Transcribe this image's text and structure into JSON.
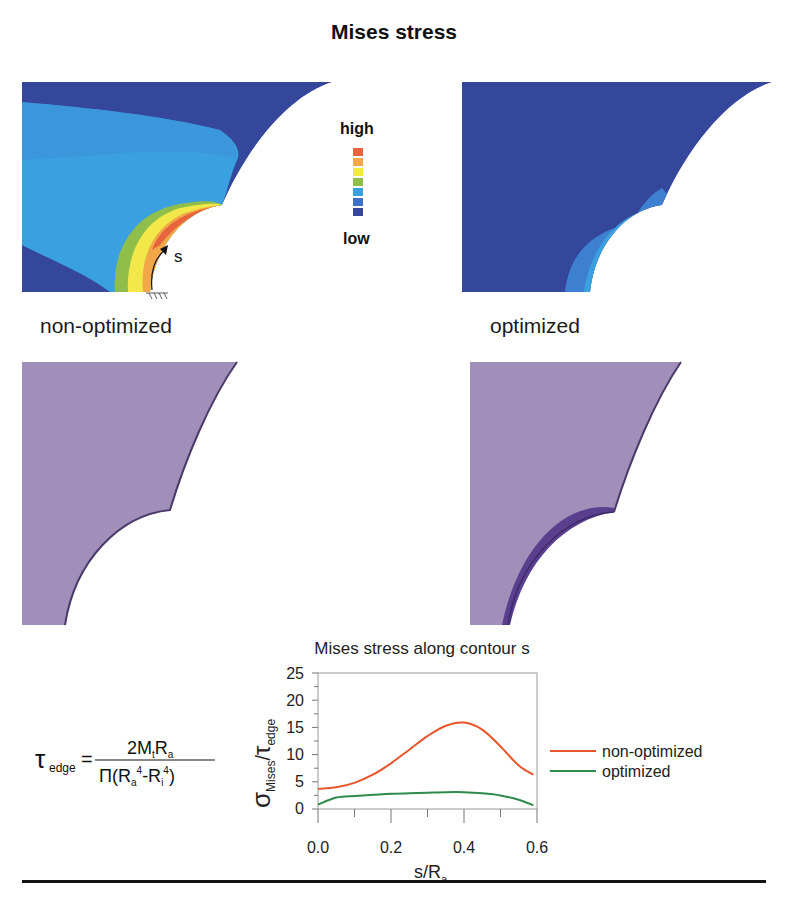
{
  "title": "Mises stress",
  "panels": {
    "stress_left_caption": "non-optimized",
    "stress_right_caption": "optimized",
    "contour_arrow_label": "s"
  },
  "color_legend": {
    "high_label": "high",
    "low_label": "low",
    "colors": [
      "#e8643c",
      "#f2a748",
      "#f2e84a",
      "#8fbf4a",
      "#3aa0e0",
      "#3e70c8",
      "#34479a"
    ]
  },
  "colors": {
    "stress_low": "#34479a",
    "stress_midlow": "#3e70c8",
    "stress_mid": "#3aa0e0",
    "stress_green": "#8fbf4a",
    "stress_yellow": "#f2e84a",
    "stress_orange": "#f2a748",
    "stress_high": "#e8643c",
    "geometry_fill": "#a08fb8",
    "geometry_edge": "#4a3a6a",
    "optimized_band": "#5a3f8f"
  },
  "formula": {
    "lhs_symbol": "τ",
    "lhs_sub": "edge",
    "equals": "=",
    "numerator": "2M",
    "num_sub_t": "t",
    "num_R": "R",
    "num_sub_a": "a",
    "den_pi": "Π(R",
    "den_sub_a": "a",
    "den_sup_4a": "4",
    "den_minus": "-R",
    "den_sub_i": "i",
    "den_sup_4i": "4",
    "den_close": ")"
  },
  "chart_data": {
    "type": "line",
    "title": "Mises stress along contour s",
    "xlabel": "s/R_a",
    "ylabel": "σ_Mises / τ_edge",
    "xlim": [
      0.0,
      0.6
    ],
    "ylim": [
      0,
      25
    ],
    "x_ticks": [
      "0.0",
      "0.2",
      "0.4",
      "0.6"
    ],
    "y_ticks": [
      "0",
      "5",
      "10",
      "15",
      "20",
      "25"
    ],
    "grid": false,
    "legend_position": "right",
    "x": [
      0.0,
      0.05,
      0.1,
      0.15,
      0.2,
      0.25,
      0.3,
      0.35,
      0.4,
      0.45,
      0.5,
      0.55,
      0.59
    ],
    "series": [
      {
        "name": "non-optimized",
        "color": "#e8552a",
        "values": [
          3.7,
          4.0,
          4.8,
          6.3,
          8.4,
          10.9,
          13.4,
          15.3,
          15.9,
          14.6,
          11.5,
          8.0,
          6.3
        ]
      },
      {
        "name": "optimized",
        "color": "#2e8b4a",
        "values": [
          0.8,
          2.1,
          2.4,
          2.6,
          2.8,
          2.9,
          3.0,
          3.1,
          3.1,
          2.9,
          2.5,
          1.7,
          0.7
        ]
      }
    ]
  },
  "chart_labels": {
    "title": "Mises stress along contour s",
    "ylabel_sigma": "σ",
    "ylabel_sigma_sub": "Mises",
    "ylabel_slash": "/",
    "ylabel_tau": "τ",
    "ylabel_tau_sub": "edge",
    "xlabel_s": "s/R",
    "xlabel_sub": "a",
    "x_ticks": [
      "0.0",
      "0.2",
      "0.4",
      "0.6"
    ],
    "y_ticks": [
      "0",
      "5",
      "10",
      "15",
      "20",
      "25"
    ],
    "legend": [
      "non-optimized",
      "optimized"
    ]
  }
}
